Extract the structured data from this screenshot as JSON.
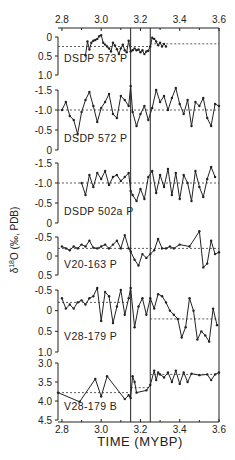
{
  "chart_data": {
    "type": "line",
    "title": "",
    "xlabel": "TIME (MYBP)",
    "ylabel": "δ18O (‰, PDB)",
    "x_range": [
      2.78,
      3.6
    ],
    "x_ticks": [
      "2.8",
      "3.0",
      "3.2",
      "3.4",
      "3.6"
    ],
    "x_tick_values": [
      2.8,
      3.0,
      3.2,
      3.4,
      3.6
    ],
    "vertical_lines": [
      3.15,
      3.25
    ],
    "grid": false,
    "legend": null,
    "panels": [
      {
        "name": "DSDP 573 P",
        "y_range": [
          0,
          1.0
        ],
        "y_inverted": true,
        "y_ticks": [
          "0",
          "0.5",
          "1.0"
        ],
        "y_tick_values": [
          0,
          0.5,
          1.0
        ],
        "reference_lines": [
          {
            "x_start": 2.78,
            "x_end": 3.25,
            "y": 0.25
          },
          {
            "x_start": 3.25,
            "x_end": 3.6,
            "y": 0.18
          }
        ],
        "x": [
          2.92,
          2.93,
          2.94,
          2.95,
          2.96,
          2.97,
          2.98,
          2.99,
          3.0,
          3.01,
          3.02,
          3.03,
          3.04,
          3.05,
          3.06,
          3.07,
          3.08,
          3.09,
          3.1,
          3.11,
          3.12,
          3.13,
          3.14,
          3.15,
          3.16,
          3.17,
          3.18,
          3.19,
          3.2,
          3.21,
          3.22,
          3.23,
          3.24,
          3.25,
          3.26,
          3.27,
          3.28,
          3.29,
          3.3,
          3.31,
          3.32,
          3.33
        ],
        "values": [
          0.48,
          0.12,
          0.33,
          0.15,
          0.1,
          0.08,
          0.05,
          -0.02,
          -0.05,
          0.15,
          0.2,
          0.25,
          0.3,
          0.38,
          0.15,
          0.22,
          0.32,
          0.45,
          0.3,
          0.2,
          0.35,
          0.4,
          0.1,
          0.38,
          0.35,
          0.3,
          0.35,
          0.33,
          0.4,
          0.35,
          0.45,
          0.38,
          0.36,
          0.25,
          0.02,
          0.05,
          0.12,
          0.22,
          0.15,
          0.25,
          0.18,
          0.25
        ]
      },
      {
        "name": "DSDP 572 P",
        "y_range": [
          -1.5,
          0
        ],
        "y_inverted": true,
        "y_ticks": [
          "-1.5",
          "-1.0",
          "-0.5",
          "0"
        ],
        "y_tick_values": [
          -1.5,
          -1.0,
          -0.5,
          0
        ],
        "reference_lines": [
          {
            "x_start": 2.78,
            "x_end": 3.6,
            "y": -1.0
          }
        ],
        "x": [
          2.8,
          2.82,
          2.84,
          2.86,
          2.88,
          2.9,
          2.92,
          2.94,
          2.96,
          2.98,
          3.0,
          3.02,
          3.04,
          3.06,
          3.08,
          3.1,
          3.12,
          3.14,
          3.15,
          3.16,
          3.18,
          3.2,
          3.22,
          3.24,
          3.26,
          3.28,
          3.3,
          3.32,
          3.34,
          3.36,
          3.38,
          3.4,
          3.42,
          3.44,
          3.46,
          3.48,
          3.5,
          3.52,
          3.54,
          3.56,
          3.58,
          3.6
        ],
        "values": [
          -1.0,
          -1.2,
          -0.85,
          -0.75,
          -0.4,
          -0.95,
          -1.25,
          -1.45,
          -1.1,
          -0.7,
          -1.05,
          -1.2,
          -1.4,
          -0.9,
          -0.8,
          -1.35,
          -1.25,
          -1.1,
          -1.6,
          -0.95,
          -0.6,
          -0.9,
          -1.1,
          -0.75,
          -1.05,
          -1.5,
          -1.2,
          -1.35,
          -1.0,
          -1.3,
          -1.55,
          -1.15,
          -0.9,
          -1.25,
          -0.6,
          -1.2,
          -1.1,
          -1.3,
          -0.8,
          -0.6,
          -1.15,
          -1.1
        ]
      },
      {
        "name": "DSDP 502a P",
        "y_range": [
          -1.5,
          0
        ],
        "y_inverted": true,
        "y_ticks": [
          "-1.5",
          "-1.0",
          "-0.5",
          "0"
        ],
        "y_tick_values": [
          -1.5,
          -1.0,
          -0.5,
          0
        ],
        "reference_lines": [
          {
            "x_start": 2.78,
            "x_end": 3.6,
            "y": -1.0
          }
        ],
        "x": [
          2.9,
          2.92,
          2.94,
          2.96,
          2.98,
          3.0,
          3.02,
          3.04,
          3.06,
          3.08,
          3.1,
          3.12,
          3.14,
          3.15,
          3.16,
          3.18,
          3.2,
          3.22,
          3.24,
          3.26,
          3.28,
          3.3,
          3.32,
          3.34,
          3.36,
          3.38,
          3.4,
          3.42,
          3.44,
          3.46,
          3.48,
          3.5,
          3.52,
          3.54,
          3.56,
          3.58
        ],
        "values": [
          -1.0,
          -0.7,
          -1.2,
          -0.9,
          -1.25,
          -1.1,
          -1.3,
          -0.95,
          -1.15,
          -1.2,
          -1.05,
          -1.15,
          -1.25,
          -0.8,
          -0.7,
          -0.55,
          -0.85,
          -0.6,
          -1.15,
          -1.3,
          -0.75,
          -1.2,
          -0.9,
          -1.35,
          -0.7,
          -1.25,
          -0.6,
          -1.2,
          -1.0,
          -0.55,
          -1.3,
          -0.9,
          -0.65,
          -1.1,
          -1.4,
          -1.15
        ]
      },
      {
        "name": "V20-163 P",
        "y_range": [
          -0.5,
          0.5
        ],
        "y_inverted": true,
        "y_ticks": [
          "-0.5",
          "0",
          "0.5"
        ],
        "y_tick_values": [
          -0.5,
          0,
          0.5
        ],
        "reference_lines": [
          {
            "x_start": 2.78,
            "x_end": 3.6,
            "y": -0.2
          }
        ],
        "x": [
          2.8,
          2.82,
          2.84,
          2.86,
          2.88,
          2.9,
          2.92,
          2.94,
          2.96,
          2.98,
          3.0,
          3.02,
          3.04,
          3.06,
          3.08,
          3.1,
          3.12,
          3.14,
          3.15,
          3.17,
          3.19,
          3.21,
          3.23,
          3.25,
          3.27,
          3.29,
          3.31,
          3.33,
          3.35,
          3.37,
          3.4,
          3.45,
          3.5,
          3.52,
          3.54,
          3.56,
          3.58,
          3.6
        ],
        "values": [
          -0.25,
          -0.2,
          -0.15,
          -0.25,
          -0.2,
          -0.3,
          -0.25,
          -0.4,
          -0.22,
          -0.2,
          -0.25,
          -0.3,
          -0.2,
          -0.3,
          -0.4,
          -0.2,
          -0.55,
          -0.2,
          -0.12,
          0.1,
          0.25,
          -0.05,
          0.05,
          -0.05,
          -0.15,
          -0.45,
          -0.2,
          -0.2,
          -0.25,
          -0.2,
          -0.3,
          -0.25,
          -0.65,
          0.3,
          0.2,
          -0.4,
          -0.05,
          -0.1
        ]
      },
      {
        "name": "V28-179 P",
        "y_range": [
          -0.5,
          1.0
        ],
        "y_inverted": true,
        "y_ticks": [
          "-0.5",
          "0",
          "0.5",
          "1.0"
        ],
        "y_tick_values": [
          -0.5,
          0,
          0.5,
          1.0
        ],
        "reference_lines": [
          {
            "x_start": 2.78,
            "x_end": 3.15,
            "y": -0.2
          },
          {
            "x_start": 3.25,
            "x_end": 3.6,
            "y": 0.2
          }
        ],
        "x": [
          2.8,
          2.82,
          2.84,
          2.86,
          2.88,
          2.9,
          2.92,
          2.94,
          2.96,
          2.98,
          3.0,
          3.02,
          3.04,
          3.06,
          3.08,
          3.1,
          3.12,
          3.14,
          3.15,
          3.17,
          3.19,
          3.21,
          3.23,
          3.25,
          3.27,
          3.29,
          3.31,
          3.33,
          3.35,
          3.37,
          3.39,
          3.41,
          3.43,
          3.45,
          3.47,
          3.49,
          3.51,
          3.53,
          3.55,
          3.57,
          3.59
        ],
        "values": [
          -0.3,
          -0.05,
          -0.15,
          -0.05,
          -0.2,
          -0.25,
          -0.15,
          -0.3,
          -0.35,
          -0.55,
          0.25,
          -0.45,
          -0.35,
          0.3,
          -0.1,
          -0.5,
          0.1,
          -0.3,
          -0.55,
          0.4,
          -0.1,
          -0.3,
          0.1,
          -0.3,
          -0.05,
          -0.4,
          -0.35,
          -0.2,
          0.0,
          0.1,
          0.2,
          0.65,
          0.4,
          -0.3,
          0.0,
          0.7,
          0.5,
          0.6,
          0.75,
          -0.05,
          0.35
        ]
      },
      {
        "name": "V28-179 B",
        "y_range": [
          3.0,
          4.5
        ],
        "y_inverted": true,
        "y_ticks": [
          "3.0",
          "3.5",
          "4.0",
          "4.5"
        ],
        "y_tick_values": [
          3.0,
          3.5,
          4.0,
          4.5
        ],
        "reference_lines": [
          {
            "x_start": 2.78,
            "x_end": 3.15,
            "y": 3.78
          },
          {
            "x_start": 3.15,
            "x_end": 3.25,
            "y": 3.65
          },
          {
            "x_start": 3.25,
            "x_end": 3.6,
            "y": 3.3
          }
        ],
        "x": [
          2.78,
          2.89,
          2.97,
          3.0,
          3.03,
          3.12,
          3.14,
          3.15,
          3.16,
          3.17,
          3.18,
          3.23,
          3.25,
          3.27,
          3.28,
          3.29,
          3.3,
          3.32,
          3.34,
          3.36,
          3.38,
          3.4,
          3.42,
          3.44,
          3.46,
          3.5,
          3.54,
          3.56,
          3.58,
          3.6
        ],
        "values": [
          3.78,
          4.02,
          3.42,
          3.88,
          3.35,
          3.95,
          3.85,
          3.92,
          3.35,
          3.5,
          3.78,
          3.72,
          3.58,
          3.2,
          3.45,
          3.25,
          3.3,
          3.38,
          3.25,
          3.5,
          3.2,
          3.55,
          3.25,
          3.5,
          3.28,
          3.32,
          3.3,
          3.45,
          3.3,
          3.25
        ]
      }
    ]
  },
  "axes": {
    "xlabel": "TIME (MYBP)",
    "ylabel_prefix": "δ",
    "ylabel_sup": "18",
    "ylabel_rest": "O (‰, PDB)"
  }
}
